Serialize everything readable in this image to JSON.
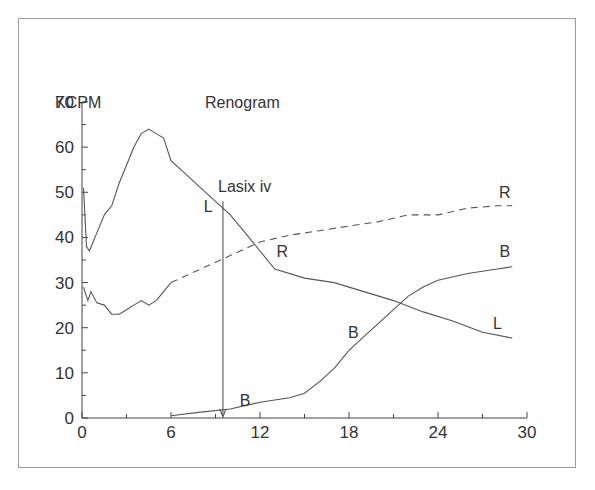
{
  "chart_data": {
    "type": "line",
    "title": "Renogram",
    "ylabel": "KCPM",
    "xlabel": "",
    "xlim": [
      0,
      30
    ],
    "ylim": [
      0,
      70
    ],
    "x_ticks": [
      "0",
      "6",
      "12",
      "18",
      "24",
      "30"
    ],
    "y_ticks": [
      "0",
      "10",
      "20",
      "30",
      "40",
      "50",
      "60",
      "70"
    ],
    "grid": false,
    "annotation": {
      "text": "Lasix iv",
      "x": 9.5,
      "arrow_from": 48,
      "arrow_to": 0
    },
    "series": [
      {
        "name": "L",
        "style": "solid",
        "points": [
          [
            0.1,
            51
          ],
          [
            0.3,
            38
          ],
          [
            0.5,
            37
          ],
          [
            1,
            41
          ],
          [
            1.5,
            45
          ],
          [
            2,
            47
          ],
          [
            2.5,
            52
          ],
          [
            3,
            56
          ],
          [
            3.5,
            60
          ],
          [
            4,
            63
          ],
          [
            4.5,
            64
          ],
          [
            5,
            63
          ],
          [
            5.5,
            62
          ],
          [
            6,
            57
          ],
          [
            7,
            54
          ],
          [
            8,
            51
          ],
          [
            9,
            48
          ],
          [
            10,
            45
          ],
          [
            11,
            41
          ],
          [
            12,
            37
          ],
          [
            13,
            33
          ],
          [
            15,
            31
          ],
          [
            17,
            30
          ],
          [
            19,
            28
          ],
          [
            21,
            26
          ],
          [
            23,
            23.5
          ],
          [
            25,
            21.5
          ],
          [
            27,
            19
          ],
          [
            29,
            17.7
          ]
        ],
        "labels": [
          {
            "text": "L",
            "x": 8.5,
            "y": 47
          },
          {
            "text": "L",
            "x": 28,
            "y": 21
          }
        ]
      },
      {
        "name": "R",
        "style": "solid then dashed (after t=6)",
        "points": [
          [
            0.1,
            29
          ],
          [
            0.4,
            26
          ],
          [
            0.6,
            28
          ],
          [
            1,
            25.5
          ],
          [
            1.5,
            25
          ],
          [
            2,
            23
          ],
          [
            2.5,
            23
          ],
          [
            3,
            24
          ],
          [
            3.5,
            25
          ],
          [
            4,
            26
          ],
          [
            4.5,
            25
          ],
          [
            5,
            26
          ],
          [
            5.5,
            28
          ],
          [
            6,
            30
          ],
          [
            8,
            33
          ],
          [
            10,
            36
          ],
          [
            12,
            39
          ],
          [
            14,
            40.5
          ],
          [
            16,
            41.5
          ],
          [
            18,
            42.5
          ],
          [
            20,
            43.5
          ],
          [
            22,
            45
          ],
          [
            24,
            45
          ],
          [
            26,
            46.5
          ],
          [
            28,
            47
          ],
          [
            29,
            47
          ]
        ],
        "labels": [
          {
            "text": "R",
            "x": 13.5,
            "y": 37
          },
          {
            "text": "R",
            "x": 28.5,
            "y": 50
          }
        ]
      },
      {
        "name": "B",
        "style": "solid",
        "points": [
          [
            6,
            0.5
          ],
          [
            8,
            1.3
          ],
          [
            10,
            2
          ],
          [
            12,
            3.5
          ],
          [
            14,
            4.5
          ],
          [
            15,
            5.5
          ],
          [
            16,
            8
          ],
          [
            17,
            11
          ],
          [
            18,
            15
          ],
          [
            19,
            18
          ],
          [
            20,
            21
          ],
          [
            21,
            24
          ],
          [
            22,
            27
          ],
          [
            23,
            29
          ],
          [
            24,
            30.5
          ],
          [
            26,
            32
          ],
          [
            28,
            33
          ],
          [
            29,
            33.5
          ]
        ],
        "labels": [
          {
            "text": "B",
            "x": 11,
            "y": 4
          },
          {
            "text": "B",
            "x": 18.3,
            "y": 19
          },
          {
            "text": "B",
            "x": 28.5,
            "y": 37
          }
        ]
      }
    ]
  },
  "colors": {
    "line": "#555555",
    "axis": "#444444",
    "frame": "#9a9a9a",
    "text": "#333333"
  }
}
